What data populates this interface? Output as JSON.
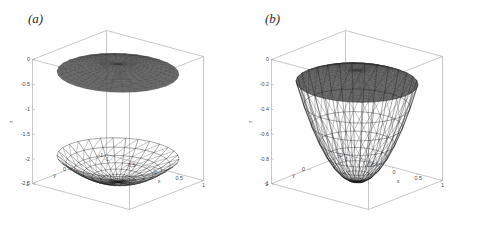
{
  "figure": {
    "background": "#ffffff",
    "axis_color": "#9a9a9a",
    "mesh_color": "#1a1a1a",
    "dark_surface_color": "#3a3a3a",
    "text_color": "#4a4a4a"
  },
  "panels": [
    {
      "id": "a",
      "label": "(a)",
      "axes": {
        "x": {
          "name": "x",
          "ticks": [
            "-1",
            "-0.5",
            "0",
            "0.5",
            "1"
          ],
          "values": [
            -1,
            -0.5,
            0,
            0.5,
            1
          ],
          "range": [
            -1,
            1
          ]
        },
        "y": {
          "name": "y",
          "ticks": [
            "1",
            "0",
            "-1"
          ],
          "values": [
            1,
            0,
            -1
          ],
          "range": [
            -1,
            1
          ]
        },
        "z": {
          "name": "r",
          "ticks": [
            "0",
            "-0.5",
            "-1",
            "-1.5",
            "-2",
            "-2.5"
          ],
          "values": [
            0,
            -0.5,
            -1,
            -1.5,
            -2,
            -2.5
          ],
          "range": [
            -2.5,
            0
          ]
        }
      },
      "chart_data": {
        "type": "surface",
        "title": "(a)",
        "xlabel": "x",
        "ylabel": "y",
        "zlabel": "r",
        "xlim": [
          -1,
          1
        ],
        "ylim": [
          -1,
          1
        ],
        "zlim": [
          -2.5,
          0
        ],
        "grid": true,
        "legend": "none",
        "surfaces": [
          {
            "name": "upper-flat-disk",
            "style": "dark-filled-mesh",
            "domain": "unit-disk",
            "description": "nearly flat dark triangulated disk just below z = 0",
            "z_center": -0.12,
            "z_rim": -0.3,
            "radial_divisions": 14,
            "angular_divisions": 36
          },
          {
            "name": "lower-shallow-bowl",
            "style": "white-wireframe",
            "domain": "unit-disk",
            "description": "shallow upward-opening paraboloid bowl, rim near z = -2, vertex near z = -2.5",
            "z_center": -2.5,
            "z_rim": -2.0,
            "radial_divisions": 7,
            "angular_divisions": 24
          }
        ]
      }
    },
    {
      "id": "b",
      "label": "(b)",
      "axes": {
        "x": {
          "name": "x",
          "ticks": [
            "-1",
            "-0.5",
            "0",
            "0.5",
            "1"
          ],
          "values": [
            -1,
            -0.5,
            0,
            0.5,
            1
          ],
          "range": [
            -1,
            1
          ]
        },
        "y": {
          "name": "y",
          "ticks": [
            "1",
            "0",
            "-1"
          ],
          "values": [
            1,
            0,
            -1
          ],
          "range": [
            -1,
            1
          ]
        },
        "z": {
          "name": "r",
          "ticks": [
            "0",
            "-0.2",
            "-0.4",
            "-0.6",
            "-0.8",
            "-1"
          ],
          "values": [
            0,
            -0.2,
            -0.4,
            -0.6,
            -0.8,
            -1
          ],
          "range": [
            -1,
            0
          ]
        }
      },
      "chart_data": {
        "type": "surface",
        "title": "(b)",
        "xlabel": "x",
        "ylabel": "y",
        "zlabel": "r",
        "xlim": [
          -1,
          1
        ],
        "ylim": [
          -1,
          1
        ],
        "zlim": [
          -1,
          0
        ],
        "grid": true,
        "legend": "none",
        "surfaces": [
          {
            "name": "upper-flat-disk",
            "style": "dark-filled-mesh",
            "domain": "unit-disk",
            "description": "nearly flat dark triangulated disk just below z = 0, meeting the bowl rim",
            "z_center": -0.1,
            "z_rim": -0.2,
            "radial_divisions": 14,
            "angular_divisions": 36
          },
          {
            "name": "lower-deep-bowl",
            "style": "white-wireframe",
            "domain": "unit-disk",
            "description": "deep upward-opening paraboloid bowl, rim near z = -0.2, vertex at z = -1",
            "z_center": -1.0,
            "z_rim": -0.2,
            "radial_divisions": 8,
            "angular_divisions": 24
          }
        ]
      }
    }
  ]
}
